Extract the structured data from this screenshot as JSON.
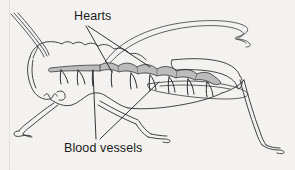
{
  "figure": {
    "background_color": "#f4f3f1",
    "ink_color": "#2b2b2b",
    "heart_fill_color": "#b9b9b9",
    "labels": [
      {
        "id": "hearts",
        "text": "Hearts"
      },
      {
        "id": "blood_vessels",
        "text": "Blood vessels"
      }
    ]
  },
  "annotations": {
    "hearts_label": "Hearts",
    "blood_vessels_label": "Blood vessels"
  },
  "anatomy": {
    "antennae_count": 3,
    "heart_chamber_count": 8,
    "blood_vessel_count": 12,
    "legs_visible": 4,
    "wings_visible": 2
  },
  "leader_lines": {
    "hearts": [
      {
        "from_x": 86,
        "from_y": 25,
        "to_x": 112,
        "to_y": 72
      },
      {
        "from_x": 89,
        "from_y": 25,
        "to_x": 150,
        "to_y": 67
      }
    ],
    "blood_vessels": [
      {
        "from_x": 97,
        "from_y": 139,
        "to_x": 93,
        "to_y": 72
      },
      {
        "from_x": 101,
        "from_y": 139,
        "to_x": 158,
        "to_y": 82
      }
    ]
  }
}
